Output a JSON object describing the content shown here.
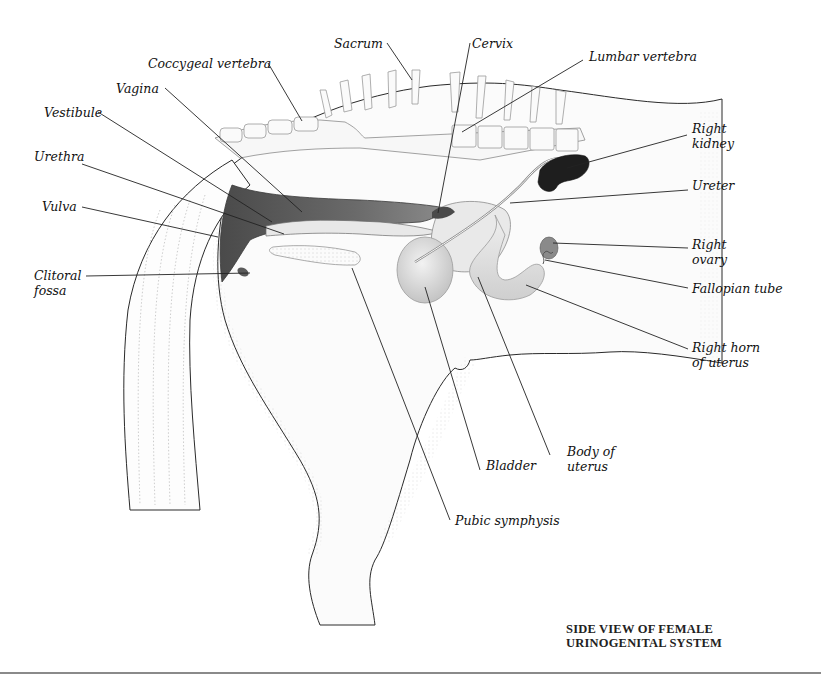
{
  "title": {
    "line1": "SIDE VIEW OF FEMALE",
    "line2": "URINOGENITAL SYSTEM"
  },
  "labels": {
    "coccygeal_vertebra": "Coccygeal vertebra",
    "sacrum": "Sacrum",
    "cervix": "Cervix",
    "lumbar_vertebra": "Lumbar vertebra",
    "vagina": "Vagina",
    "vestibule": "Vestibule",
    "urethra": "Urethra",
    "vulva": "Vulva",
    "clitoral_fossa": "Clitoral\nfossa",
    "right_kidney": "Right\nkidney",
    "ureter": "Ureter",
    "right_ovary": "Right\novary",
    "fallopian_tube": "Fallopian tube",
    "right_horn_of_uterus": "Right horn\nof uterus",
    "bladder": "Bladder",
    "body_of_uterus": "Body of\nuterus",
    "pubic_symphysis": "Pubic symphysis"
  },
  "colors": {
    "outline": "#2a2a2a",
    "leader_line": "#222222",
    "tissue_light": "#f3f3f3",
    "organ_mid": "#d9d9d9",
    "vagina_dark": "#5e5e5e",
    "kidney": "#1e1e1e",
    "bone": "#f7f7f7",
    "bottom_rule": "#8a8a8a"
  }
}
